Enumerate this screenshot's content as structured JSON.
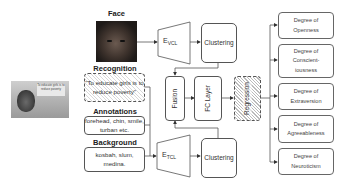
{
  "diagram": {
    "inputs": {
      "face": {
        "label": "Face"
      },
      "recognition": {
        "label": "Recognition",
        "text": "\"To educate girls is to reduce poverty\""
      },
      "annotations": {
        "label": "Annotations",
        "text": "forehead, chin, smile, turban etc."
      },
      "background": {
        "label": "Background",
        "text": "kosbah, slum, medina."
      }
    },
    "main_image": {
      "sign_text": "To educate girls is to reduce poverty"
    },
    "encoders": {
      "visual": {
        "base": "E",
        "sub": "VCL"
      },
      "textual": {
        "base": "E",
        "sub": "TCL"
      }
    },
    "clustering_top": "Clustering",
    "clustering_bottom": "Clustering",
    "fusion": "Fusion",
    "fc_layer": "FC Layer",
    "regression": "Regression",
    "outputs": [
      {
        "line1": "Degree of",
        "line2": "Openness"
      },
      {
        "line1": "Degree of",
        "line2": "Conscient-",
        "line3": "iousness"
      },
      {
        "line1": "Degree of",
        "line2": "Extraversion"
      },
      {
        "line1": "Degree of",
        "line2": "Agreeableness"
      },
      {
        "line1": "Degree of",
        "line2": "Neuroticism"
      }
    ]
  }
}
